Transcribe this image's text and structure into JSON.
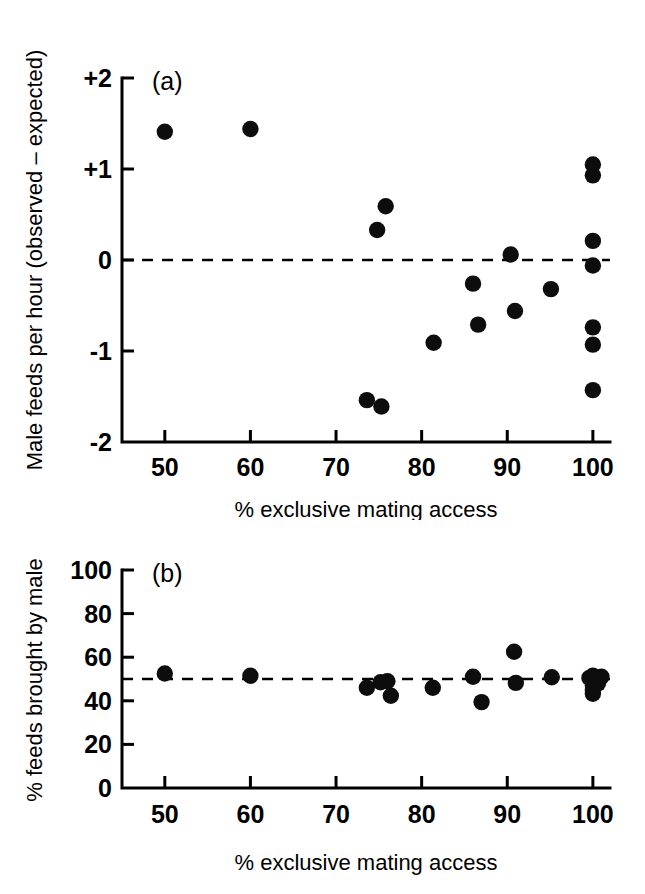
{
  "figure": {
    "background_color": "#ffffff",
    "point_color": "#0d0d0d",
    "axis_color": "#000000"
  },
  "chart_data": [
    {
      "type": "scatter",
      "panel_label": "(a)",
      "title": "",
      "xlabel": "% exclusive mating access",
      "ylabel": "Male feeds per hour (observed – expected)",
      "xlim": [
        45,
        102
      ],
      "ylim": [
        -2,
        2
      ],
      "xticks": [
        50,
        60,
        70,
        80,
        90,
        100
      ],
      "xticklabels": [
        "50",
        "60",
        "70",
        "80",
        "90",
        "100"
      ],
      "yticks": [
        -2,
        -1,
        0,
        1,
        2
      ],
      "yticklabels": [
        "-2",
        "-1",
        "0",
        "+1",
        "+2"
      ],
      "grid": false,
      "legend": "none",
      "reference_line": {
        "orientation": "horizontal",
        "value": 0,
        "style": "dashed"
      },
      "points": [
        {
          "x": 50.0,
          "y": 1.41
        },
        {
          "x": 60.0,
          "y": 1.44
        },
        {
          "x": 74.8,
          "y": 0.33
        },
        {
          "x": 75.8,
          "y": 0.59
        },
        {
          "x": 73.6,
          "y": -1.54
        },
        {
          "x": 75.3,
          "y": -1.61
        },
        {
          "x": 81.4,
          "y": -0.91
        },
        {
          "x": 86.0,
          "y": -0.26
        },
        {
          "x": 86.6,
          "y": -0.71
        },
        {
          "x": 90.4,
          "y": 0.06
        },
        {
          "x": 90.9,
          "y": -0.56
        },
        {
          "x": 95.1,
          "y": -0.32
        },
        {
          "x": 100.0,
          "y": 1.05
        },
        {
          "x": 100.0,
          "y": 0.93
        },
        {
          "x": 100.0,
          "y": 0.21
        },
        {
          "x": 100.0,
          "y": -0.06
        },
        {
          "x": 100.0,
          "y": -0.74
        },
        {
          "x": 100.0,
          "y": -0.93
        },
        {
          "x": 100.0,
          "y": -1.43
        }
      ]
    },
    {
      "type": "scatter",
      "panel_label": "(b)",
      "title": "",
      "xlabel": "% exclusive mating access",
      "ylabel": "% feeds brought by male",
      "xlim": [
        45,
        102
      ],
      "ylim": [
        0,
        100
      ],
      "xticks": [
        50,
        60,
        70,
        80,
        90,
        100
      ],
      "xticklabels": [
        "50",
        "60",
        "70",
        "80",
        "90",
        "100"
      ],
      "yticks": [
        0,
        20,
        40,
        60,
        80,
        100
      ],
      "yticklabels": [
        "0",
        "20",
        "40",
        "60",
        "80",
        "100"
      ],
      "grid": false,
      "legend": "none",
      "reference_line": {
        "orientation": "horizontal",
        "value": 50,
        "style": "dashed"
      },
      "points": [
        {
          "x": 50.0,
          "y": 52.5
        },
        {
          "x": 60.0,
          "y": 51.5
        },
        {
          "x": 73.6,
          "y": 46.0
        },
        {
          "x": 75.2,
          "y": 48.5
        },
        {
          "x": 76.0,
          "y": 49.0
        },
        {
          "x": 76.4,
          "y": 42.3
        },
        {
          "x": 81.3,
          "y": 46.0
        },
        {
          "x": 86.0,
          "y": 51.0
        },
        {
          "x": 87.0,
          "y": 39.4
        },
        {
          "x": 90.8,
          "y": 62.5
        },
        {
          "x": 91.0,
          "y": 48.2
        },
        {
          "x": 95.2,
          "y": 50.8
        },
        {
          "x": 99.6,
          "y": 50.5
        },
        {
          "x": 100.0,
          "y": 51.5
        },
        {
          "x": 100.0,
          "y": 49.0
        },
        {
          "x": 100.0,
          "y": 47.0
        },
        {
          "x": 100.0,
          "y": 45.0
        },
        {
          "x": 100.0,
          "y": 43.2
        },
        {
          "x": 100.6,
          "y": 48.0
        },
        {
          "x": 101.0,
          "y": 51.0
        }
      ]
    }
  ]
}
